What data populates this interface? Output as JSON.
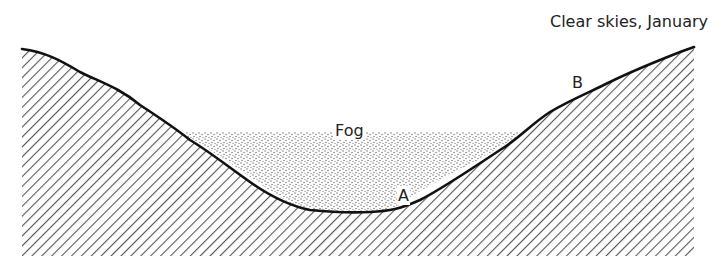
{
  "diagram": {
    "title": "Clear skies, January",
    "labels": {
      "fog": "Fog",
      "point_a": "A",
      "point_b": "B"
    },
    "regions": [
      {
        "name": "terrain",
        "fill": "diagonal-hatch",
        "color": "#444444"
      },
      {
        "name": "fog",
        "fill": "stipple",
        "color": "#555555"
      }
    ],
    "colors": {
      "background": "#ffffff",
      "outline": "#111111",
      "hatch": "#555555",
      "stipple": "#666666"
    }
  }
}
